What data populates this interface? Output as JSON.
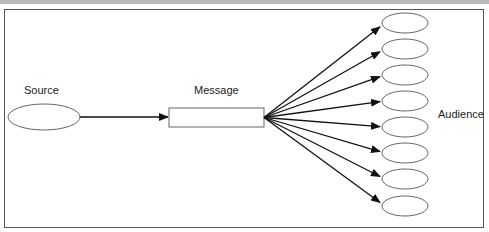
{
  "diagram": {
    "type": "communication-model",
    "labels": {
      "source": "Source",
      "message": "Message",
      "audience": "Audience"
    },
    "nodes": {
      "source": {
        "shape": "ellipse",
        "cx": 44,
        "cy": 117,
        "rx": 36,
        "ry": 13
      },
      "message": {
        "shape": "rect",
        "x": 169,
        "y": 108,
        "w": 95,
        "h": 19
      },
      "audience": [
        {
          "cx": 405,
          "cy": 23
        },
        {
          "cx": 405,
          "cy": 49
        },
        {
          "cx": 405,
          "cy": 75
        },
        {
          "cx": 405,
          "cy": 101
        },
        {
          "cx": 405,
          "cy": 127
        },
        {
          "cx": 405,
          "cy": 153
        },
        {
          "cx": 405,
          "cy": 179
        },
        {
          "cx": 405,
          "cy": 206
        }
      ]
    },
    "edges": [
      {
        "from": "source",
        "to": "message"
      },
      {
        "from": "message",
        "to": "audience",
        "count": 8
      }
    ],
    "colors": {
      "stroke": "#555555",
      "arrow": "#111111",
      "band": "#b9b9b9"
    }
  }
}
